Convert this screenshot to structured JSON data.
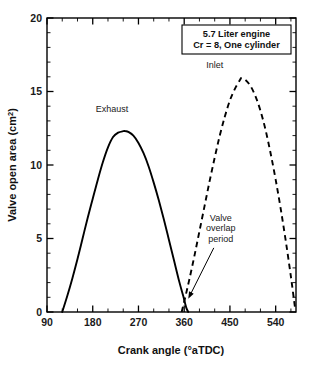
{
  "chart_data": {
    "type": "line",
    "title": "",
    "xlabel": "Crank angle (°aTDC)",
    "ylabel": "Valve open area (cm²)",
    "ylabel_base": "Valve open area (cm",
    "ylabel_sup": "2",
    "ylabel_tail": ")",
    "xlim": [
      90,
      580
    ],
    "ylim": [
      0,
      20
    ],
    "grid": false,
    "legend_position": "inline-labels",
    "x_ticks_major": [
      90,
      180,
      270,
      360,
      450,
      540
    ],
    "x_ticks_major_labels": [
      "90",
      "180",
      "270",
      "360",
      "450",
      "540"
    ],
    "x_tick_minor_step": 30,
    "y_ticks_major": [
      0,
      5,
      10,
      15,
      20
    ],
    "y_ticks_major_labels": [
      "0",
      "5",
      "10",
      "15",
      "20"
    ],
    "y_tick_minor_step": 1,
    "series": [
      {
        "name": "Exhaust",
        "style": "solid",
        "color": "#000000",
        "label_x": 218,
        "label_y": 13.6,
        "peak_x": 245,
        "peak_y": 12.3,
        "open_x": 120,
        "close_x": 368,
        "x": [
          120,
          130,
          140,
          150,
          160,
          170,
          180,
          190,
          200,
          210,
          220,
          230,
          240,
          245,
          250,
          260,
          270,
          280,
          290,
          300,
          310,
          320,
          330,
          340,
          350,
          358,
          364,
          368
        ],
        "y": [
          0.0,
          1.1,
          2.3,
          3.6,
          5.0,
          6.4,
          7.7,
          9.0,
          10.2,
          11.2,
          11.9,
          12.2,
          12.3,
          12.3,
          12.25,
          12.0,
          11.5,
          10.8,
          9.9,
          8.8,
          7.6,
          6.3,
          4.9,
          3.5,
          2.1,
          1.1,
          0.3,
          0.0
        ]
      },
      {
        "name": "Inlet",
        "style": "dashed",
        "color": "#000000",
        "label_x": 420,
        "label_y": 16.6,
        "peak_x": 472,
        "peak_y": 15.9,
        "open_x": 355,
        "close_x": 578,
        "x": [
          355,
          362,
          370,
          380,
          390,
          400,
          410,
          420,
          430,
          440,
          450,
          460,
          470,
          472,
          480,
          490,
          500,
          510,
          520,
          530,
          540,
          550,
          560,
          570,
          578
        ],
        "y": [
          0.0,
          1.0,
          2.2,
          3.8,
          5.5,
          7.2,
          8.9,
          10.5,
          12.0,
          13.3,
          14.4,
          15.2,
          15.8,
          15.9,
          15.8,
          15.4,
          14.7,
          13.7,
          12.4,
          10.8,
          9.0,
          7.0,
          4.8,
          2.4,
          0.3
        ]
      }
    ],
    "annotations": [
      {
        "id": "overlap-annotation",
        "lines": [
          "Valve",
          "overlap",
          "period"
        ],
        "text_x": 432,
        "text_y": 6.2,
        "target_x": 368,
        "target_y": 0.9
      }
    ],
    "info_box": {
      "lines": [
        "5.7 Liter engine",
        "Cr = 8, One cylinder"
      ],
      "line1": "5.7 Liter engine",
      "line2": "Cr = 8, One cylinder"
    }
  }
}
